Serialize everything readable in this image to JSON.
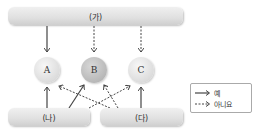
{
  "diagram": {
    "top_box": {
      "label": "(가)"
    },
    "bottom_left_box": {
      "label": "(나)"
    },
    "bottom_right_box": {
      "label": "(다)"
    },
    "nodes": [
      {
        "label": "A",
        "shade": "light"
      },
      {
        "label": "B",
        "shade": "dark"
      },
      {
        "label": "C",
        "shade": "light"
      }
    ],
    "edges": [
      {
        "from": "(가)",
        "to": "A",
        "style": "solid",
        "meaning": "예"
      },
      {
        "from": "(가)",
        "to": "B",
        "style": "dashed",
        "meaning": "아니요"
      },
      {
        "from": "(가)",
        "to": "C",
        "style": "dashed",
        "meaning": "아니요"
      },
      {
        "from": "(나)",
        "to": "A",
        "style": "solid",
        "meaning": "예"
      },
      {
        "from": "(나)",
        "to": "B",
        "style": "solid",
        "meaning": "예"
      },
      {
        "from": "(나)",
        "to": "C",
        "style": "dashed",
        "meaning": "아니요"
      },
      {
        "from": "(다)",
        "to": "A",
        "style": "dashed",
        "meaning": "아니요"
      },
      {
        "from": "(다)",
        "to": "B",
        "style": "dashed",
        "meaning": "아니요"
      },
      {
        "from": "(다)",
        "to": "C",
        "style": "solid",
        "meaning": "예"
      }
    ]
  },
  "legend": {
    "solid_label": "예",
    "dashed_label": "아니요"
  },
  "colors": {
    "arrow": "#444444",
    "box_fill": "#e0e0e0",
    "node_light": "#dcdcdc",
    "node_dark": "#b8b8b8"
  }
}
